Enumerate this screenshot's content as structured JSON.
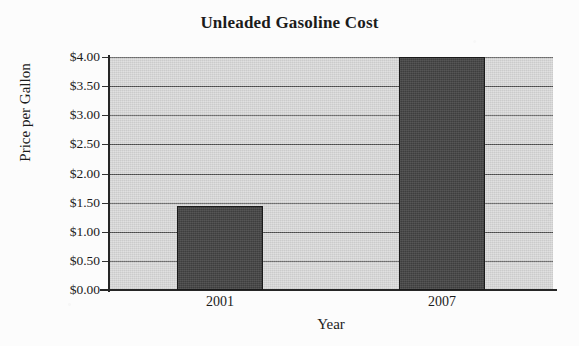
{
  "chart_data": {
    "type": "bar",
    "title": "Unleaded Gasoline Cost",
    "xlabel": "Year",
    "ylabel": "Price per Gallon",
    "categories": [
      "2001",
      "2007"
    ],
    "values": [
      1.45,
      4.0
    ],
    "series": [
      {
        "name": "Price per Gallon",
        "values": [
          1.45,
          4.0
        ]
      }
    ],
    "ylim": [
      0,
      4
    ],
    "ytick_step": 0.5,
    "ytick_labels": [
      "$4.00",
      "$3.50",
      "$3.00",
      "$2.50",
      "$2.00",
      "$1.50",
      "$1.00",
      "$0.50",
      "$0.00"
    ],
    "ytick_values": [
      4.0,
      3.5,
      3.0,
      2.5,
      2.0,
      1.5,
      1.0,
      0.5,
      0.0
    ],
    "grid": "horizontal",
    "legend": "none",
    "colors": {
      "bar_fill": "#464646",
      "bar_border": "#1a1a1a",
      "plot_background": "#d3d3d3",
      "gridline": "#4b4b4b",
      "axis": "#262626",
      "text": "#1b1b1b",
      "page_background": "#fcfcfc"
    }
  }
}
